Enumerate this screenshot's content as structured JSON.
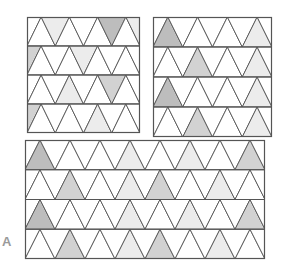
{
  "figure": {
    "label": "A",
    "colors": {
      "line": "#555555",
      "white": "#ffffff",
      "light": "#ececec",
      "medium": "#d2d2d2",
      "dark": "#bdbdbd"
    }
  },
  "panels": [
    {
      "id": "top-left",
      "x": 27,
      "y": 17,
      "w": 113,
      "h": 116,
      "rows": 4,
      "cols": 4,
      "shading": [
        [
          "w",
          "w",
          "l",
          "w",
          "w",
          "w",
          "d",
          "w",
          "l"
        ],
        [
          "m",
          "w",
          "w",
          "w",
          "l",
          "w",
          "w",
          "w",
          "w"
        ],
        [
          "w",
          "w",
          "w",
          "l",
          "w",
          "w",
          "m",
          "w",
          "w"
        ],
        [
          "m",
          "w",
          "w",
          "w",
          "w",
          "l",
          "w",
          "w",
          "w"
        ]
      ]
    },
    {
      "id": "top-right",
      "x": 153,
      "y": 17,
      "w": 119,
      "h": 120,
      "rows": 4,
      "cols": 4,
      "shading": [
        [
          "w",
          "d",
          "w",
          "w",
          "w",
          "w",
          "w",
          "l",
          "w"
        ],
        [
          "w",
          "w",
          "w",
          "m",
          "w",
          "w",
          "w",
          "l",
          "w"
        ],
        [
          "w",
          "d",
          "w",
          "w",
          "w",
          "w",
          "w",
          "l",
          "w"
        ],
        [
          "w",
          "w",
          "w",
          "m",
          "w",
          "w",
          "w",
          "l",
          "w"
        ]
      ]
    },
    {
      "id": "bottom",
      "x": 25,
      "y": 140,
      "w": 240,
      "h": 119,
      "rows": 4,
      "cols": 8,
      "shading": [
        [
          "w",
          "d",
          "w",
          "w",
          "w",
          "w",
          "w",
          "l",
          "w",
          "w",
          "w",
          "l",
          "w",
          "w",
          "w",
          "m",
          "w"
        ],
        [
          "w",
          "w",
          "w",
          "m",
          "w",
          "w",
          "w",
          "l",
          "w",
          "m",
          "w",
          "w",
          "w",
          "l",
          "w",
          "w",
          "w"
        ],
        [
          "w",
          "d",
          "w",
          "w",
          "w",
          "w",
          "w",
          "l",
          "w",
          "w",
          "w",
          "l",
          "w",
          "w",
          "w",
          "m",
          "w"
        ],
        [
          "w",
          "w",
          "w",
          "m",
          "w",
          "w",
          "w",
          "l",
          "w",
          "m",
          "w",
          "w",
          "w",
          "l",
          "w",
          "w",
          "w"
        ]
      ]
    }
  ]
}
